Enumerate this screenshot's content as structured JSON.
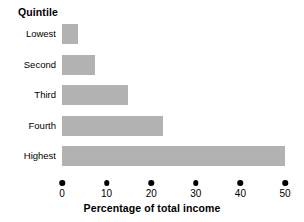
{
  "chart_data": {
    "type": "bar",
    "orientation": "horizontal",
    "title": "",
    "xlabel": "Percentage of total income",
    "ylabel": "Quintile",
    "categories": [
      "Lowest",
      "Second",
      "Third",
      "Fourth",
      "Highest"
    ],
    "values": [
      3.6,
      7.4,
      14.8,
      22.6,
      50.0
    ],
    "xlim": [
      0,
      50
    ],
    "xticks": [
      0,
      10,
      20,
      30,
      40,
      50
    ],
    "xtick_labels": [
      "0",
      "10",
      "20",
      "30",
      "40",
      "50"
    ],
    "grid": false,
    "legend": false,
    "bar_color": "#b2b2b2",
    "axis_color": "#000000",
    "background": "#ffffff"
  },
  "axes": {
    "category_axis_title": "Quintile",
    "value_axis_title": "Percentage of total income"
  }
}
